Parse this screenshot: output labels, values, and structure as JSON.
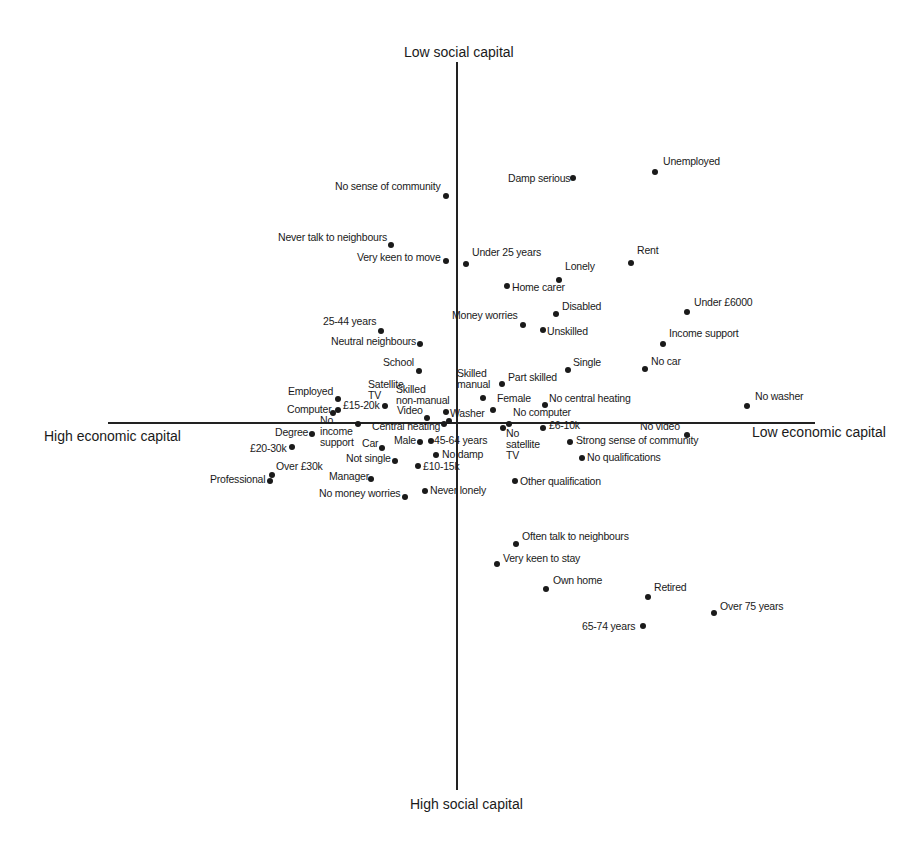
{
  "chart_data": {
    "type": "scatter",
    "title": "",
    "xlabel_left": "High economic capital",
    "xlabel_right": "Low economic capital",
    "ylabel_top": "Low social capital",
    "ylabel_bottom": "High social capital",
    "grid": false,
    "legend": null,
    "axes": {
      "x_axis_pixel": {
        "x1": 108,
        "x2": 815,
        "y": 423
      },
      "y_axis_pixel": {
        "x": 457,
        "y1": 62,
        "y2": 790
      }
    },
    "points": [
      {
        "label": "Unemployed",
        "x": 655,
        "y": 172,
        "lx": 663,
        "ly": 161
      },
      {
        "label": "Damp serious",
        "x": 573,
        "y": 178,
        "lx": 508,
        "ly": 178
      },
      {
        "label": "No sense of community",
        "x": 446,
        "y": 196,
        "lx": 335,
        "ly": 186
      },
      {
        "label": "Never talk to neighbours",
        "x": 391,
        "y": 245,
        "lx": 278,
        "ly": 237
      },
      {
        "label": "Very keen to move",
        "x": 446,
        "y": 261,
        "lx": 357,
        "ly": 257
      },
      {
        "label": "Under 25 years",
        "x": 466,
        "y": 264,
        "lx": 472,
        "ly": 252
      },
      {
        "label": "Rent",
        "x": 631,
        "y": 263,
        "lx": 637,
        "ly": 250
      },
      {
        "label": "Lonely",
        "x": 559,
        "y": 280,
        "lx": 565,
        "ly": 266
      },
      {
        "label": "Home carer",
        "x": 507,
        "y": 286,
        "lx": 512,
        "ly": 287
      },
      {
        "label": "Under £6000",
        "x": 687,
        "y": 312,
        "lx": 694,
        "ly": 302
      },
      {
        "label": "Disabled",
        "x": 556,
        "y": 314,
        "lx": 562,
        "ly": 306
      },
      {
        "label": "Money worries",
        "x": 523,
        "y": 325,
        "lx": 452,
        "ly": 315
      },
      {
        "label": "Unskilled",
        "x": 543,
        "y": 330,
        "lx": 547,
        "ly": 331
      },
      {
        "label": "25-44 years",
        "x": 381,
        "y": 331,
        "lx": 323,
        "ly": 321
      },
      {
        "label": "Income support",
        "x": 663,
        "y": 344,
        "lx": 669,
        "ly": 333
      },
      {
        "label": "Neutral neighbours",
        "x": 420,
        "y": 344,
        "lx": 331,
        "ly": 341
      },
      {
        "label": "Single",
        "x": 568,
        "y": 370,
        "lx": 573,
        "ly": 362
      },
      {
        "label": "No car",
        "x": 645,
        "y": 369,
        "lx": 651,
        "ly": 361
      },
      {
        "label": "School",
        "x": 419,
        "y": 371,
        "lx": 383,
        "ly": 362
      },
      {
        "label": "Part skilled",
        "x": 502,
        "y": 384,
        "lx": 508,
        "ly": 377
      },
      {
        "label": "Skilled\nmanual",
        "x": 483,
        "y": 398,
        "lx": 457,
        "ly": 373
      },
      {
        "label": "Satellite\nTV",
        "x": 385,
        "y": 406,
        "lx": 368,
        "ly": 384
      },
      {
        "label": "Skilled\nnon-manual",
        "x": 446,
        "y": 412,
        "lx": 396,
        "ly": 389
      },
      {
        "label": "Employed",
        "x": 338,
        "y": 399,
        "lx": 288,
        "ly": 391
      },
      {
        "label": "No washer",
        "x": 747,
        "y": 406,
        "lx": 755,
        "ly": 396
      },
      {
        "label": "Female",
        "x": 493,
        "y": 410,
        "lx": 497,
        "ly": 398
      },
      {
        "label": "No central heating",
        "x": 545,
        "y": 405,
        "lx": 549,
        "ly": 398
      },
      {
        "label": "£15-20k",
        "x": 338,
        "y": 410,
        "lx": 343,
        "ly": 405
      },
      {
        "label": "Computer",
        "x": 333,
        "y": 413,
        "lx": 287,
        "ly": 409
      },
      {
        "label": "Video",
        "x": 427,
        "y": 418,
        "lx": 397,
        "ly": 410
      },
      {
        "label": "Washer",
        "x": 449,
        "y": 421,
        "lx": 450,
        "ly": 413
      },
      {
        "label": "No computer",
        "x": 509,
        "y": 424,
        "lx": 513,
        "ly": 412
      },
      {
        "label": "No\nincome\nsupport",
        "x": 358,
        "y": 424,
        "lx": 320,
        "ly": 420
      },
      {
        "label": "Central heating",
        "x": 444,
        "y": 424,
        "lx": 372,
        "ly": 426
      },
      {
        "label": "No\nsatellite\nTV",
        "x": 503,
        "y": 428,
        "lx": 506,
        "ly": 433
      },
      {
        "label": "£6-10k",
        "x": 543,
        "y": 428,
        "lx": 549,
        "ly": 425
      },
      {
        "label": "No video",
        "x": 687,
        "y": 435,
        "lx": 640,
        "ly": 426
      },
      {
        "label": "Degree",
        "x": 312,
        "y": 434,
        "lx": 275,
        "ly": 432
      },
      {
        "label": "Strong sense of community",
        "x": 570,
        "y": 442,
        "lx": 576,
        "ly": 440
      },
      {
        "label": "Male",
        "x": 420,
        "y": 442,
        "lx": 394,
        "ly": 440
      },
      {
        "label": "45-64 years",
        "x": 431,
        "y": 441,
        "lx": 434,
        "ly": 440
      },
      {
        "label": "Car",
        "x": 382,
        "y": 448,
        "lx": 362,
        "ly": 443
      },
      {
        "label": "£20-30k",
        "x": 292,
        "y": 447,
        "lx": 250,
        "ly": 448
      },
      {
        "label": "No damp",
        "x": 436,
        "y": 455,
        "lx": 442,
        "ly": 454
      },
      {
        "label": "No qualifications",
        "x": 582,
        "y": 458,
        "lx": 587,
        "ly": 457
      },
      {
        "label": "Not single",
        "x": 395,
        "y": 461,
        "lx": 346,
        "ly": 458
      },
      {
        "label": "£10-15k",
        "x": 418,
        "y": 466,
        "lx": 423,
        "ly": 466
      },
      {
        "label": "Over £30k",
        "x": 272,
        "y": 475,
        "lx": 276,
        "ly": 466
      },
      {
        "label": "Professional",
        "x": 270,
        "y": 481,
        "lx": 210,
        "ly": 479
      },
      {
        "label": "Manager",
        "x": 371,
        "y": 479,
        "lx": 329,
        "ly": 476
      },
      {
        "label": "Other qualification",
        "x": 515,
        "y": 481,
        "lx": 520,
        "ly": 481
      },
      {
        "label": "Never lonely",
        "x": 425,
        "y": 491,
        "lx": 430,
        "ly": 490
      },
      {
        "label": "No money worries",
        "x": 405,
        "y": 497,
        "lx": 319,
        "ly": 493
      },
      {
        "label": "Often talk to neighbours",
        "x": 516,
        "y": 544,
        "lx": 522,
        "ly": 536
      },
      {
        "label": "Very keen to stay",
        "x": 497,
        "y": 564,
        "lx": 503,
        "ly": 558
      },
      {
        "label": "Own home",
        "x": 546,
        "y": 589,
        "lx": 553,
        "ly": 580
      },
      {
        "label": "Retired",
        "x": 648,
        "y": 597,
        "lx": 654,
        "ly": 587
      },
      {
        "label": "Over 75 years",
        "x": 714,
        "y": 613,
        "lx": 720,
        "ly": 606
      },
      {
        "label": "65-74 years",
        "x": 643,
        "y": 626,
        "lx": 582,
        "ly": 626
      }
    ]
  }
}
